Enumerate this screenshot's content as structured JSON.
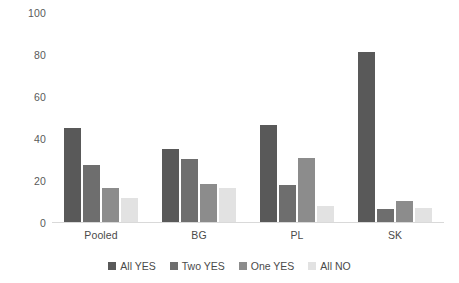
{
  "chart_data": {
    "type": "bar",
    "title": "",
    "xlabel": "",
    "ylabel": "",
    "ylim": [
      0,
      100
    ],
    "ytick_labels": [
      "0",
      "20",
      "40",
      "60",
      "80",
      "100"
    ],
    "yticks": [
      0,
      20,
      40,
      60,
      80,
      100
    ],
    "grid": false,
    "legend_position": "bottom",
    "categories": [
      "Pooled",
      "BG",
      "PL",
      "SK"
    ],
    "series": [
      {
        "name": "All YES",
        "color": "#595959",
        "values": [
          45,
          35,
          46,
          81
        ]
      },
      {
        "name": "Two YES",
        "color": "#6e6e6e",
        "values": [
          27,
          30,
          17.5,
          6
        ]
      },
      {
        "name": "One YES",
        "color": "#8c8c8c",
        "values": [
          16,
          18,
          30.5,
          10
        ]
      },
      {
        "name": "All NO",
        "color": "#e2e2e2",
        "values": [
          11.5,
          16,
          7.5,
          6.5
        ]
      }
    ]
  },
  "axis": {
    "baseline_color": "#d9d9d9",
    "tick_text_color": "#5a5a5a"
  }
}
